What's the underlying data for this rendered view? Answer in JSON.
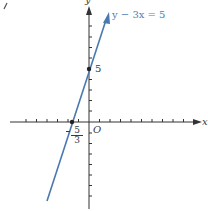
{
  "diagram": {
    "type": "coordinate-plane-line-graph",
    "equation_label": "y − 3x = 5",
    "axes": {
      "x_label": "x",
      "y_label": "y",
      "origin_label": "O"
    },
    "points": [
      {
        "name": "y-intercept",
        "x": 0,
        "y": 5,
        "label": "5"
      },
      {
        "name": "x-intercept",
        "x": "-5/3",
        "y": 0,
        "label_sign": "−",
        "label_numerator": "5",
        "label_denominator": "3"
      }
    ],
    "colors": {
      "line": "#4a78b0",
      "axes": "#333333",
      "points": "#222222"
    }
  }
}
